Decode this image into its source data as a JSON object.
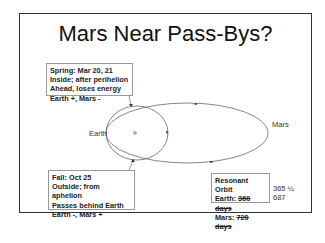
{
  "title": "Mars Near Pass-Bys?",
  "labels": {
    "earth": "Earth",
    "mars": "Mars"
  },
  "spring_callout": {
    "lines": [
      "Spring: Mar 20, 21",
      "Inside; after perihelion",
      "Ahead, loses energy",
      "Earth +, Mars -"
    ]
  },
  "fall_callout": {
    "lines": [
      "Fall: Oct 25",
      "Outside; from aphelion",
      "Passes behind Earth",
      "Earth -, Mars +"
    ]
  },
  "resonant_callout": {
    "heading": "Resonant Orbit",
    "earth_prefix": "Earth: ",
    "earth_struck": "360 days",
    "earth_actual": "365 ¼",
    "mars_prefix": "Mars: ",
    "mars_struck": "720 days",
    "mars_actual": "687"
  }
}
